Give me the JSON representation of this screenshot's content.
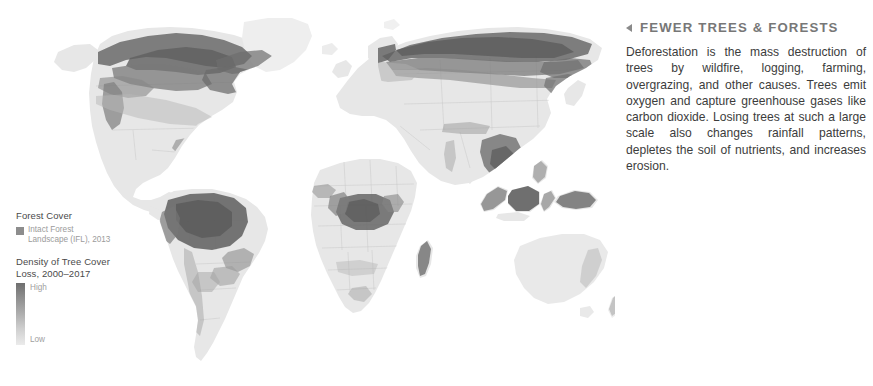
{
  "background_color": "#ffffff",
  "map": {
    "name": "world-deforestation-map",
    "projection": "robinson",
    "land_color": "#e6e6e6",
    "border_color": "#c9c9c9",
    "loss_color_high": "#5f5f5f",
    "loss_color_low": "#d8d8d8",
    "ifl_color": "#8d8d8d"
  },
  "legend": {
    "forest_cover": {
      "title": "Forest Cover",
      "swatch_color": "#8d8d8d",
      "item_label": "Intact Forest Landscape (IFL), 2013"
    },
    "density": {
      "title": "Density of Tree Cover Loss, 2000–2017",
      "high_label": "High",
      "low_label": "Low",
      "gradient_top_color": "#6f6f6f",
      "gradient_bottom_color": "#ebebeb"
    }
  },
  "info_panel": {
    "back_icon": "triangle-left-icon",
    "title": "FEWER TREES & FORESTS",
    "title_color": "#777777",
    "body": "Deforestation is the mass destruction of trees by wildfire, logging, farming, overgrazing, and other causes. Trees emit oxygen and capture greenhouse gases like carbon dioxide. Losing trees at such a large scale also changes rainfall patterns, depletes the soil of nutrients, and increases erosion."
  }
}
